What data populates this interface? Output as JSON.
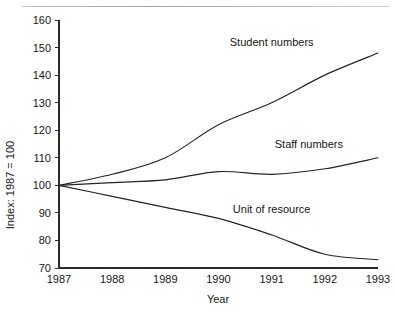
{
  "figure": {
    "top_caption_ghost": "",
    "background": "#ffffff",
    "ink_color": "#242424"
  },
  "chart_data": {
    "type": "line",
    "title": "",
    "xlabel": "Year",
    "ylabel": "Index: 1987 = 100",
    "x": [
      1987,
      1988,
      1989,
      1990,
      1991,
      1992,
      1993
    ],
    "xtick_labels": [
      "1987",
      "1988",
      "1989",
      "1990",
      "1991",
      "1992",
      "1993"
    ],
    "ytick_labels": [
      "70",
      "80",
      "90",
      "100",
      "110",
      "120",
      "130",
      "140",
      "150",
      "160"
    ],
    "yticks": [
      70,
      80,
      90,
      100,
      110,
      120,
      130,
      140,
      150,
      160
    ],
    "xlim": [
      1987,
      1993
    ],
    "ylim": [
      70,
      160
    ],
    "grid": false,
    "legend": "inline-labels",
    "series": [
      {
        "name": "Student numbers",
        "values": [
          100,
          104,
          110,
          122,
          130,
          140,
          148
        ],
        "label_x": 1991.0,
        "label_y": 150.5
      },
      {
        "name": "Staff numbers",
        "values": [
          100,
          101,
          102,
          105,
          104,
          106,
          110
        ],
        "label_x": 1991.7,
        "label_y": 113.5
      },
      {
        "name": "Unit of resource",
        "values": [
          100,
          96,
          92,
          88,
          82,
          75,
          73
        ],
        "label_x": 1991.0,
        "label_y": 90.0
      }
    ]
  },
  "axis_titles": {
    "x": "Year",
    "y": "Index: 1987 = 100"
  }
}
